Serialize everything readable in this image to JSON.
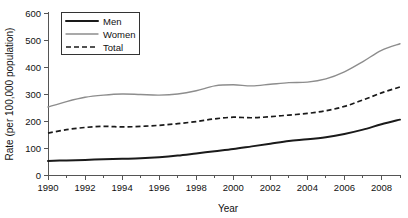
{
  "chart_data": {
    "type": "line",
    "title": "",
    "xlabel": "Year",
    "ylabel": "Rate (per 100,000 population)",
    "xlim": [
      1990,
      2009
    ],
    "ylim": [
      0,
      600
    ],
    "yticks": [
      0,
      100,
      200,
      300,
      400,
      500,
      600
    ],
    "ytick_labels": [
      "0",
      "100",
      "200",
      "300",
      "400",
      "500",
      "600"
    ],
    "xticks": [
      1990,
      1992,
      1994,
      1996,
      1998,
      2000,
      2002,
      2004,
      2006,
      2008
    ],
    "xtick_labels": [
      "1990",
      "1992",
      "1994",
      "1996",
      "1998",
      "2000",
      "2002",
      "2004",
      "2006",
      "2008"
    ],
    "minor_xticks": [
      1991,
      1993,
      1995,
      1997,
      1999,
      2001,
      2003,
      2005,
      2007,
      2009
    ],
    "grid": false,
    "legend_position": "top-left",
    "x": [
      1990,
      1991,
      1992,
      1993,
      1994,
      1995,
      1996,
      1997,
      1998,
      1999,
      2000,
      2001,
      2002,
      2003,
      2004,
      2005,
      2006,
      2007,
      2008,
      2009
    ],
    "series": [
      {
        "name": "Men",
        "color": "#1a1a1a",
        "style": "solid-thick",
        "values": [
          52,
          54,
          56,
          58,
          60,
          62,
          66,
          72,
          80,
          88,
          96,
          106,
          116,
          126,
          132,
          140,
          152,
          168,
          188,
          205
        ]
      },
      {
        "name": "Women",
        "color": "#8d8d8d",
        "style": "solid-thin",
        "values": [
          252,
          272,
          288,
          296,
          300,
          298,
          296,
          300,
          312,
          330,
          334,
          330,
          336,
          342,
          344,
          356,
          382,
          420,
          462,
          486
        ]
      },
      {
        "name": "Total",
        "color": "#1a1a1a",
        "style": "dashed",
        "values": [
          155,
          168,
          176,
          180,
          178,
          180,
          184,
          190,
          198,
          208,
          214,
          212,
          216,
          222,
          228,
          238,
          254,
          278,
          304,
          326
        ]
      }
    ]
  },
  "legend": {
    "items": [
      {
        "label": "Men"
      },
      {
        "label": "Women"
      },
      {
        "label": "Total"
      }
    ]
  }
}
